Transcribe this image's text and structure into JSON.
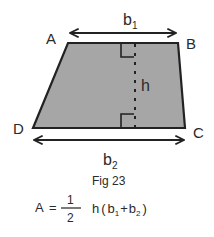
{
  "figure": {
    "vertices": {
      "A": "A",
      "B": "B",
      "C": "C",
      "D": "D"
    },
    "top_base": {
      "var": "b",
      "sub": "1"
    },
    "bottom_base": {
      "var": "b",
      "sub": "2"
    },
    "height_label": "h",
    "caption": "Fig 23",
    "fill_color": "#a6a6a6",
    "stroke_color": "#222222"
  },
  "formula": {
    "lhs": "A",
    "eq": "=",
    "numerator": "1",
    "denominator": "2",
    "h": "h",
    "open": "(",
    "b1_var": "b",
    "b1_sub": "1",
    "plus": "+",
    "b2_var": "b",
    "b2_sub": "2",
    "close": ")"
  }
}
